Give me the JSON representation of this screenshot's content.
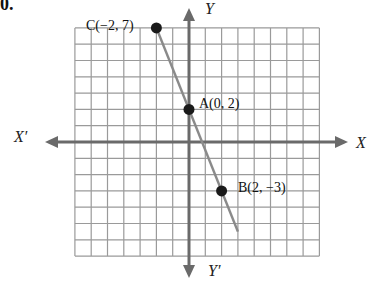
{
  "problem": {
    "number": "0."
  },
  "axes": {
    "x_pos": "X",
    "x_neg": "X′",
    "y_pos": "Y",
    "y_neg": "Y′"
  },
  "grid": {
    "x_min": -7,
    "x_max": 8,
    "y_min": -7,
    "y_max": 7,
    "unit_px": 16.3,
    "origin_px": [
      189,
      142
    ]
  },
  "points": [
    {
      "name": "C",
      "label": "C(−2, 7)",
      "x": -2,
      "y": 7
    },
    {
      "name": "A",
      "label": "A(0, 2)",
      "x": 0,
      "y": 2
    },
    {
      "name": "B",
      "label": "B(2, −3)",
      "x": 2,
      "y": -3
    }
  ],
  "line": {
    "color": "#8a8a8a",
    "from": [
      -2,
      7
    ],
    "to": [
      3,
      -5.5
    ]
  },
  "colors": {
    "grid": "#9a9a9a",
    "axis": "#6a6a6a",
    "point": "#1a1a1a"
  }
}
